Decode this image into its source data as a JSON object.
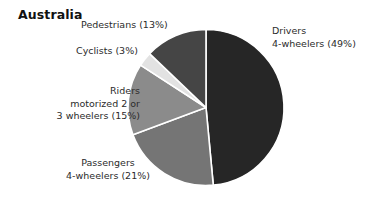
{
  "chart_data": {
    "type": "pie",
    "title": "Australia",
    "subtitle": "",
    "xlabel": "",
    "ylabel": "",
    "unit": "%",
    "start_angle_deg": 0,
    "direction": "clockwise",
    "legend_position": "none (direct labels)",
    "grid": false,
    "categories": [
      "Drivers 4-wheelers",
      "Passengers 4-wheelers",
      "Riders motorized 2 or 3 wheelers",
      "Cyclists",
      "Pedestrians"
    ],
    "values": [
      49,
      21,
      15,
      3,
      13
    ],
    "colors": [
      "#262626",
      "#757575",
      "#8b8b8b",
      "#e2e2e2",
      "#454545"
    ],
    "slices": [
      {
        "name": "Drivers 4-wheelers",
        "value": 49,
        "value_text": "(49%)",
        "color": "#262626",
        "label_lines": [
          "Drivers",
          "4-wheelers (49%)"
        ]
      },
      {
        "name": "Passengers 4-wheelers",
        "value": 21,
        "value_text": "(21%)",
        "color": "#757575",
        "label_lines": [
          "Passengers",
          "4-wheelers (21%)"
        ]
      },
      {
        "name": "Riders motorized 2 or 3 wheelers",
        "value": 15,
        "value_text": "(15%)",
        "color": "#8b8b8b",
        "label_lines": [
          "Riders",
          "motorized 2 or",
          "3 wheelers (15%)"
        ]
      },
      {
        "name": "Cyclists",
        "value": 3,
        "value_text": "(3%)",
        "color": "#e2e2e2",
        "label_lines": [
          "Cyclists (3%)"
        ]
      },
      {
        "name": "Pedestrians",
        "value": 13,
        "value_text": "(13%)",
        "color": "#454545",
        "label_lines": [
          "Pedestrians (13%)"
        ]
      }
    ]
  },
  "labels": {
    "drivers_line1": "Drivers",
    "drivers_line2": "4-wheelers (49%)",
    "passengers_line1": "Passengers",
    "passengers_line2": "4-wheelers (21%)",
    "riders_line1": "Riders",
    "riders_line2": "motorized 2 or",
    "riders_line3": "3 wheelers (15%)",
    "cyclists_line1": "Cyclists (3%)",
    "pedestrians_line1": "Pedestrians (13%)"
  },
  "style": {
    "background": "#ffffff",
    "separator_color": "#ffffff",
    "text_color": "#2b2b2b",
    "title_color": "#111111"
  }
}
